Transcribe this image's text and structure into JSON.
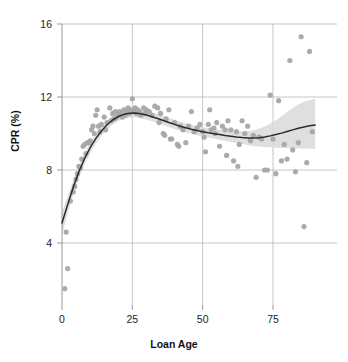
{
  "chart_data": {
    "type": "scatter",
    "title": "",
    "subtitle": "",
    "xlabel": "Loan Age",
    "ylabel": "CPR (%)",
    "xlim": [
      -3,
      95
    ],
    "ylim": [
      0.6,
      16.8
    ],
    "xticks": [
      0,
      25,
      50,
      75
    ],
    "yticks": [
      4,
      8,
      12,
      16
    ],
    "xtick_labels": [
      "0",
      "25",
      "50",
      "75"
    ],
    "ytick_labels": [
      "4",
      "8",
      "12",
      "16"
    ],
    "grid": true,
    "legend": "none",
    "colors": {
      "point": "#a6a6a6",
      "line": "#2b2b2b",
      "ribbon": "#d9d9d9",
      "grid": "#b8b8b8",
      "axis": "#8c8c8c",
      "text": "#1d1d1d"
    },
    "series": [
      {
        "name": "CPR observations",
        "type": "scatter",
        "points": [
          [
            1.0,
            1.5
          ],
          [
            2.0,
            2.6
          ],
          [
            1.5,
            4.6
          ],
          [
            3.0,
            6.3
          ],
          [
            4.0,
            6.8
          ],
          [
            4.5,
            7.1
          ],
          [
            5.0,
            7.5
          ],
          [
            5.5,
            7.8
          ],
          [
            6.0,
            8.2
          ],
          [
            6.5,
            8.1
          ],
          [
            7.0,
            8.6
          ],
          [
            7.5,
            9.3
          ],
          [
            8.0,
            9.4
          ],
          [
            8.5,
            8.9
          ],
          [
            9.0,
            9.5
          ],
          [
            9.5,
            9.5
          ],
          [
            10.0,
            9.6
          ],
          [
            10.5,
            10.2
          ],
          [
            11.0,
            10.4
          ],
          [
            11.5,
            10.0
          ],
          [
            12.0,
            11.0
          ],
          [
            12.5,
            11.3
          ],
          [
            13.0,
            10.4
          ],
          [
            13.5,
            10.1
          ],
          [
            14.0,
            10.5
          ],
          [
            15.0,
            10.9
          ],
          [
            15.5,
            10.2
          ],
          [
            16.0,
            10.6
          ],
          [
            17.0,
            11.4
          ],
          [
            17.5,
            10.7
          ],
          [
            18.0,
            11.1
          ],
          [
            18.5,
            10.8
          ],
          [
            19.0,
            11.2
          ],
          [
            19.5,
            10.9
          ],
          [
            20.0,
            11.0
          ],
          [
            20.5,
            11.2
          ],
          [
            21.0,
            11.1
          ],
          [
            21.5,
            10.9
          ],
          [
            22.0,
            11.3
          ],
          [
            22.5,
            11.0
          ],
          [
            23.0,
            11.2
          ],
          [
            23.5,
            11.4
          ],
          [
            24.0,
            11.1
          ],
          [
            24.5,
            11.3
          ],
          [
            25.0,
            11.9
          ],
          [
            25.5,
            11.2
          ],
          [
            26.0,
            11.4
          ],
          [
            26.5,
            11.1
          ],
          [
            27.0,
            11.3
          ],
          [
            27.5,
            11.2
          ],
          [
            28.0,
            11.0
          ],
          [
            29.0,
            11.4
          ],
          [
            29.5,
            11.1
          ],
          [
            30.0,
            11.3
          ],
          [
            31.0,
            11.2
          ],
          [
            32.0,
            11.0
          ],
          [
            33.0,
            11.5
          ],
          [
            34.0,
            11.4
          ],
          [
            34.5,
            10.6
          ],
          [
            35.0,
            11.1
          ],
          [
            36.0,
            10.0
          ],
          [
            36.5,
            9.9
          ],
          [
            37.0,
            10.8
          ],
          [
            38.0,
            11.3
          ],
          [
            38.5,
            9.7
          ],
          [
            39.0,
            9.7
          ],
          [
            40.0,
            10.6
          ],
          [
            41.0,
            9.4
          ],
          [
            41.5,
            9.3
          ],
          [
            42.0,
            10.4
          ],
          [
            43.0,
            10.2
          ],
          [
            44.0,
            9.5
          ],
          [
            45.0,
            10.4
          ],
          [
            46.0,
            11.2
          ],
          [
            47.0,
            10.1
          ],
          [
            48.0,
            10.3
          ],
          [
            49.0,
            10.5
          ],
          [
            50.0,
            10.1
          ],
          [
            50.5,
            9.8
          ],
          [
            51.0,
            9.0
          ],
          [
            52.0,
            10.5
          ],
          [
            52.5,
            11.3
          ],
          [
            53.0,
            10.2
          ],
          [
            54.0,
            10.3
          ],
          [
            54.5,
            10.0
          ],
          [
            55.0,
            10.6
          ],
          [
            56.0,
            9.3
          ],
          [
            57.0,
            10.4
          ],
          [
            58.0,
            10.2
          ],
          [
            58.5,
            8.8
          ],
          [
            59.0,
            10.7
          ],
          [
            60.0,
            10.2
          ],
          [
            61.0,
            8.5
          ],
          [
            62.0,
            10.1
          ],
          [
            62.5,
            8.2
          ],
          [
            63.0,
            9.4
          ],
          [
            64.0,
            10.7
          ],
          [
            65.0,
            10.0
          ],
          [
            66.0,
            10.4
          ],
          [
            67.0,
            9.6
          ],
          [
            68.0,
            9.9
          ],
          [
            69.0,
            7.6
          ],
          [
            70.0,
            9.8
          ],
          [
            71.0,
            9.7
          ],
          [
            72.0,
            8.0
          ],
          [
            73.0,
            8.0
          ],
          [
            74.0,
            12.1
          ],
          [
            75.0,
            9.7
          ],
          [
            76.0,
            7.8
          ],
          [
            77.0,
            11.8
          ],
          [
            78.0,
            8.5
          ],
          [
            79.0,
            9.4
          ],
          [
            80.0,
            8.6
          ],
          [
            81.0,
            14.0
          ],
          [
            82.0,
            9.1
          ],
          [
            83.0,
            7.9
          ],
          [
            84.0,
            9.5
          ],
          [
            85.0,
            15.3
          ],
          [
            86.0,
            4.9
          ],
          [
            87.0,
            8.4
          ],
          [
            88.0,
            14.5
          ],
          [
            89.0,
            10.1
          ]
        ]
      },
      {
        "name": "Smoothed fit",
        "type": "line",
        "points": [
          [
            0.0,
            5.1
          ],
          [
            2.0,
            6.1
          ],
          [
            4.0,
            7.05
          ],
          [
            6.0,
            7.9
          ],
          [
            8.0,
            8.62
          ],
          [
            10.0,
            9.22
          ],
          [
            12.0,
            9.72
          ],
          [
            14.0,
            10.14
          ],
          [
            16.0,
            10.48
          ],
          [
            18.0,
            10.74
          ],
          [
            20.0,
            10.93
          ],
          [
            22.0,
            11.05
          ],
          [
            24.0,
            11.11
          ],
          [
            26.0,
            11.12
          ],
          [
            28.0,
            11.08
          ],
          [
            30.0,
            11.01
          ],
          [
            32.0,
            10.92
          ],
          [
            34.0,
            10.82
          ],
          [
            36.0,
            10.71
          ],
          [
            38.0,
            10.6
          ],
          [
            40.0,
            10.5
          ],
          [
            42.0,
            10.4
          ],
          [
            44.0,
            10.31
          ],
          [
            46.0,
            10.23
          ],
          [
            48.0,
            10.16
          ],
          [
            50.0,
            10.1
          ],
          [
            52.0,
            10.04
          ],
          [
            54.0,
            9.99
          ],
          [
            56.0,
            9.94
          ],
          [
            58.0,
            9.89
          ],
          [
            60.0,
            9.85
          ],
          [
            62.0,
            9.81
          ],
          [
            64.0,
            9.78
          ],
          [
            66.0,
            9.76
          ],
          [
            68.0,
            9.75
          ],
          [
            70.0,
            9.77
          ],
          [
            72.0,
            9.81
          ],
          [
            74.0,
            9.87
          ],
          [
            76.0,
            9.94
          ],
          [
            78.0,
            10.02
          ],
          [
            80.0,
            10.11
          ],
          [
            82.0,
            10.2
          ],
          [
            84.0,
            10.29
          ],
          [
            86.0,
            10.36
          ],
          [
            88.0,
            10.42
          ],
          [
            90.0,
            10.46
          ]
        ]
      },
      {
        "name": "Confidence band",
        "type": "ribbon",
        "lower": [
          [
            0.0,
            4.45
          ],
          [
            2.0,
            5.6
          ],
          [
            4.0,
            6.65
          ],
          [
            6.0,
            7.55
          ],
          [
            8.0,
            8.3
          ],
          [
            10.0,
            8.92
          ],
          [
            12.0,
            9.44
          ],
          [
            14.0,
            9.87
          ],
          [
            16.0,
            10.22
          ],
          [
            18.0,
            10.49
          ],
          [
            20.0,
            10.68
          ],
          [
            22.0,
            10.8
          ],
          [
            24.0,
            10.86
          ],
          [
            26.0,
            10.87
          ],
          [
            28.0,
            10.83
          ],
          [
            30.0,
            10.76
          ],
          [
            32.0,
            10.67
          ],
          [
            34.0,
            10.57
          ],
          [
            36.0,
            10.46
          ],
          [
            38.0,
            10.35
          ],
          [
            40.0,
            10.25
          ],
          [
            42.0,
            10.15
          ],
          [
            44.0,
            10.06
          ],
          [
            46.0,
            9.98
          ],
          [
            48.0,
            9.91
          ],
          [
            50.0,
            9.85
          ],
          [
            52.0,
            9.78
          ],
          [
            54.0,
            9.72
          ],
          [
            56.0,
            9.66
          ],
          [
            58.0,
            9.6
          ],
          [
            60.0,
            9.54
          ],
          [
            62.0,
            9.48
          ],
          [
            64.0,
            9.42
          ],
          [
            66.0,
            9.37
          ],
          [
            68.0,
            9.32
          ],
          [
            70.0,
            9.29
          ],
          [
            72.0,
            9.26
          ],
          [
            74.0,
            9.24
          ],
          [
            76.0,
            9.22
          ],
          [
            78.0,
            9.21
          ],
          [
            80.0,
            9.2
          ],
          [
            82.0,
            9.19
          ],
          [
            84.0,
            9.18
          ],
          [
            86.0,
            9.17
          ],
          [
            88.0,
            9.16
          ],
          [
            90.0,
            9.15
          ]
        ],
        "upper": [
          [
            0.0,
            5.7
          ],
          [
            2.0,
            6.58
          ],
          [
            4.0,
            7.42
          ],
          [
            6.0,
            8.22
          ],
          [
            8.0,
            8.92
          ],
          [
            10.0,
            9.5
          ],
          [
            12.0,
            9.99
          ],
          [
            14.0,
            10.4
          ],
          [
            16.0,
            10.73
          ],
          [
            18.0,
            10.99
          ],
          [
            20.0,
            11.18
          ],
          [
            22.0,
            11.3
          ],
          [
            24.0,
            11.36
          ],
          [
            26.0,
            11.37
          ],
          [
            28.0,
            11.33
          ],
          [
            30.0,
            11.26
          ],
          [
            32.0,
            11.17
          ],
          [
            34.0,
            11.07
          ],
          [
            36.0,
            10.96
          ],
          [
            38.0,
            10.85
          ],
          [
            40.0,
            10.75
          ],
          [
            42.0,
            10.65
          ],
          [
            44.0,
            10.56
          ],
          [
            46.0,
            10.48
          ],
          [
            48.0,
            10.41
          ],
          [
            50.0,
            10.35
          ],
          [
            52.0,
            10.3
          ],
          [
            54.0,
            10.26
          ],
          [
            56.0,
            10.22
          ],
          [
            58.0,
            10.19
          ],
          [
            60.0,
            10.16
          ],
          [
            62.0,
            10.14
          ],
          [
            64.0,
            10.13
          ],
          [
            66.0,
            10.14
          ],
          [
            68.0,
            10.18
          ],
          [
            70.0,
            10.26
          ],
          [
            72.0,
            10.38
          ],
          [
            74.0,
            10.54
          ],
          [
            76.0,
            10.73
          ],
          [
            78.0,
            10.95
          ],
          [
            80.0,
            11.18
          ],
          [
            82.0,
            11.4
          ],
          [
            84.0,
            11.59
          ],
          [
            86.0,
            11.74
          ],
          [
            88.0,
            11.84
          ],
          [
            90.0,
            11.9
          ]
        ]
      }
    ]
  }
}
